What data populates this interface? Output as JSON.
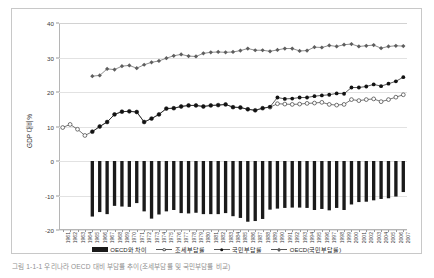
{
  "figure": {
    "caption": "그림 1-1-1 우리나라 OECD 대비 부담률 추이(조세부담률 및 국민부담률 비교)"
  },
  "chart_data": {
    "type": "line",
    "title": "",
    "xlabel": "",
    "ylabel": "GDP 대비%",
    "ylim": [
      -20,
      40
    ],
    "yticks": [
      40,
      30,
      20,
      10,
      0,
      -10,
      -20
    ],
    "grid": true,
    "legend_position": "bottom",
    "categories": [
      "1961",
      "1962",
      "1963",
      "1964",
      "1965",
      "1966",
      "1967",
      "1968",
      "1969",
      "1970",
      "1971",
      "1972",
      "1973",
      "1974",
      "1975",
      "1976",
      "1977",
      "1978",
      "1979",
      "1980",
      "1981",
      "1982",
      "1983",
      "1984",
      "1985",
      "1986",
      "1987",
      "1988",
      "1989",
      "1990",
      "1991",
      "1992",
      "1993",
      "1994",
      "1995",
      "1996",
      "1997",
      "1998",
      "1999",
      "2000",
      "2001",
      "2002",
      "2003",
      "2004",
      "2005",
      "2006",
      "2007"
    ],
    "series": [
      {
        "name": "OECD와 차이",
        "type": "bar",
        "color": "#1a1a1a",
        "values": [
          null,
          null,
          null,
          null,
          -16.1,
          -14.8,
          -15.4,
          -13.0,
          -13.2,
          -13.3,
          -12.2,
          -14.6,
          -16.7,
          -15.5,
          -14.6,
          -14.2,
          -15.1,
          -15.2,
          -15.0,
          -15.4,
          -15.4,
          -15.4,
          -15.1,
          -16.0,
          -16.5,
          -17.6,
          -17.4,
          -16.8,
          -14.1,
          -13.8,
          -13.6,
          -13.5,
          -13.5,
          -13.6,
          -14.2,
          -13.9,
          -14.3,
          -13.6,
          -14.2,
          -12.6,
          -11.9,
          -11.8,
          -11.4,
          -11.0,
          -10.8,
          -10.3,
          -9.0
        ]
      },
      {
        "name": "조세부담률",
        "type": "line",
        "marker": "hollow-circle",
        "color": "#3b3b3b",
        "values": [
          9.7,
          10.6,
          9.2,
          7.4,
          8.5,
          10.0,
          11.3,
          13.5,
          14.3,
          14.4,
          14.2,
          11.3,
          12.3,
          13.5,
          15.2,
          15.3,
          15.8,
          16.1,
          16.1,
          15.8,
          16.1,
          16.2,
          16.4,
          15.6,
          15.5,
          15.0,
          14.7,
          15.3,
          15.6,
          16.6,
          16.5,
          16.4,
          16.5,
          16.7,
          16.8,
          17.0,
          16.4,
          16.2,
          16.4,
          17.8,
          17.5,
          17.8,
          18.0,
          17.2,
          17.8,
          18.5,
          19.2
        ]
      },
      {
        "name": "국민부담률",
        "type": "line",
        "marker": "solid-circle",
        "color": "#121212",
        "values": [
          null,
          null,
          null,
          null,
          8.5,
          10.0,
          11.3,
          13.5,
          14.3,
          14.4,
          14.2,
          11.3,
          12.3,
          13.5,
          15.2,
          15.3,
          15.8,
          16.1,
          16.1,
          15.8,
          16.1,
          16.2,
          16.4,
          15.6,
          15.5,
          15.0,
          14.7,
          15.3,
          15.7,
          18.4,
          18.0,
          18.1,
          18.4,
          18.4,
          18.8,
          19.0,
          19.2,
          19.6,
          19.5,
          21.3,
          21.3,
          21.6,
          22.2,
          21.7,
          22.4,
          23.1,
          24.3
        ]
      },
      {
        "name": "OECD(국민부담률)",
        "type": "line",
        "marker": "diamond",
        "color": "#5e5e5e",
        "values": [
          null,
          null,
          null,
          null,
          24.6,
          24.8,
          26.7,
          26.5,
          27.5,
          27.7,
          26.9,
          27.9,
          28.6,
          29.0,
          29.8,
          30.5,
          30.9,
          30.4,
          30.3,
          31.2,
          31.5,
          31.6,
          31.5,
          31.6,
          32.0,
          32.6,
          32.1,
          32.1,
          31.8,
          32.2,
          32.6,
          32.6,
          31.9,
          32.0,
          33.0,
          32.9,
          33.5,
          33.2,
          33.7,
          33.9,
          33.2,
          33.4,
          33.6,
          32.7,
          33.2,
          33.4,
          33.3
        ]
      }
    ]
  },
  "legend": {
    "items": [
      {
        "label": "OECD와 차이",
        "marker": "bar-swatch"
      },
      {
        "label": "조세부담률",
        "marker": "hollow-circle-marker"
      },
      {
        "label": "국민부담률",
        "marker": "solid-circle-marker"
      },
      {
        "label": "OECD(국민부담률)",
        "marker": "diamond-marker"
      }
    ]
  }
}
